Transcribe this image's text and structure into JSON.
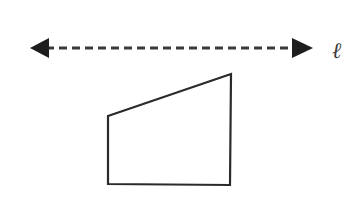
{
  "diagram": {
    "line": {
      "label": "ℓ",
      "style": "dashed",
      "arrows": "both",
      "y": 48,
      "x_start": 30,
      "x_end": 313,
      "color": "#2a2a2a"
    },
    "shape": {
      "type": "quadrilateral",
      "description": "right trapezoid with two vertical sides below line ℓ",
      "vertices": [
        [
          108,
          116
        ],
        [
          231,
          74
        ],
        [
          230,
          185
        ],
        [
          108,
          184
        ]
      ],
      "stroke": "#2a2a2a",
      "fill": "#ffffff"
    }
  }
}
